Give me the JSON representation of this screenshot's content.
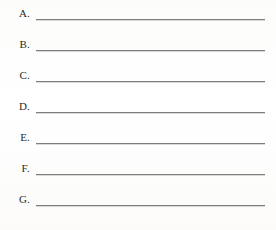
{
  "document": {
    "type": "answer-sheet",
    "title": "Lettered answer lines worksheet",
    "background_color": "#fdfdfc",
    "rule_color": "#7e7e7e",
    "text_color": "#2b2b2b",
    "row_count": 7
  },
  "rows": [
    {
      "label": "A.",
      "answer": ""
    },
    {
      "label": "B.",
      "answer": ""
    },
    {
      "label": "C.",
      "answer": ""
    },
    {
      "label": "D.",
      "answer": ""
    },
    {
      "label": "E.",
      "answer": ""
    },
    {
      "label": "F.",
      "answer": ""
    },
    {
      "label": "G.",
      "answer": ""
    }
  ]
}
